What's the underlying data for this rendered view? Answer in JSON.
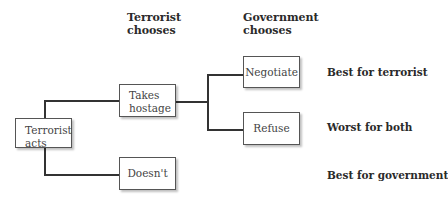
{
  "headers": {
    "terrorist_chooses": "Terrorist chooses",
    "government_chooses": "Government chooses"
  },
  "nodes": {
    "root": "Terrorist acts",
    "takes_hostage": "Takes hostage",
    "doesnt": "Doesn't",
    "negotiate": "Negotiate",
    "refuse": "Refuse"
  },
  "outcomes": {
    "negotiate": "Best for terrorist",
    "refuse": "Worst for both",
    "doesnt": "Best for government"
  }
}
